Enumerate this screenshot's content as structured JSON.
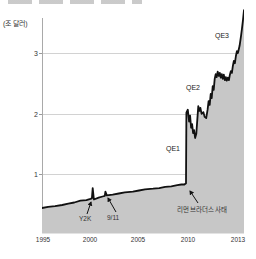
{
  "chart": {
    "unit_label": "(조 달러)",
    "y_tick_labels": [
      "3",
      "2",
      "1"
    ],
    "x_tick_labels": [
      "1995",
      "2000",
      "2005",
      "2010",
      "2013"
    ],
    "labels": {
      "qe1": "QE1",
      "qe2": "QE2",
      "qe3": "QE3",
      "y2k": "Y2K",
      "nine_eleven": "9/11",
      "lehman": "리먼 브라더스 사태"
    }
  },
  "chart_data": {
    "type": "area",
    "title": "",
    "ylabel": "(조 달러)",
    "xlabel": "",
    "x_axis": {
      "ticks": [
        "1995",
        "2000",
        "2005",
        "2010",
        "2013"
      ]
    },
    "y_axis": {
      "ticks": [
        1,
        2,
        3
      ],
      "range": [
        0,
        3.9
      ]
    },
    "grid": true,
    "legend": false,
    "colors": {
      "area_fill": "#c7c7c7",
      "line": "#111111",
      "grid": "#d2d2d2"
    },
    "annotations": [
      {
        "label": "Y2K",
        "x_frac": 0.251,
        "value": 0.77,
        "note": "brief spike near 2000"
      },
      {
        "label": "9/11",
        "x_frac": 0.314,
        "value": 0.71,
        "note": "brief bump in 2001"
      },
      {
        "label": "리먼 브라더스 사태",
        "x_frac": 0.714,
        "value": 0.85,
        "note": "vertical jump from ~0.85 to ~2.0"
      },
      {
        "label": "QE1",
        "x_frac": 0.75,
        "value": 2.0,
        "note": "plateau ~1.6-2.1"
      },
      {
        "label": "QE2",
        "x_frac": 0.85,
        "value": 2.65,
        "note": "rise to plateau ~2.6-2.7"
      },
      {
        "label": "QE3",
        "x_frac": 0.97,
        "value": 3.4,
        "note": "rise to ~3.7 by 2013"
      }
    ],
    "series": [
      {
        "points": [
          [
            0.0,
            0.44
          ],
          [
            0.03,
            0.46
          ],
          [
            0.065,
            0.47
          ],
          [
            0.1,
            0.49
          ],
          [
            0.13,
            0.51
          ],
          [
            0.16,
            0.53
          ],
          [
            0.19,
            0.56
          ],
          [
            0.22,
            0.57
          ],
          [
            0.24,
            0.59
          ],
          [
            0.247,
            0.6
          ],
          [
            0.251,
            0.77
          ],
          [
            0.257,
            0.58
          ],
          [
            0.28,
            0.61
          ],
          [
            0.3,
            0.63
          ],
          [
            0.311,
            0.64
          ],
          [
            0.314,
            0.71
          ],
          [
            0.321,
            0.65
          ],
          [
            0.35,
            0.66
          ],
          [
            0.38,
            0.68
          ],
          [
            0.41,
            0.7
          ],
          [
            0.45,
            0.71
          ],
          [
            0.48,
            0.73
          ],
          [
            0.51,
            0.75
          ],
          [
            0.55,
            0.76
          ],
          [
            0.58,
            0.77
          ],
          [
            0.61,
            0.79
          ],
          [
            0.64,
            0.8
          ],
          [
            0.67,
            0.82
          ],
          [
            0.69,
            0.83
          ],
          [
            0.705,
            0.83
          ],
          [
            0.713,
            0.85
          ],
          [
            0.715,
            2.02
          ],
          [
            0.722,
            2.07
          ],
          [
            0.728,
            1.87
          ],
          [
            0.733,
            1.97
          ],
          [
            0.738,
            1.77
          ],
          [
            0.743,
            1.83
          ],
          [
            0.748,
            1.68
          ],
          [
            0.753,
            1.73
          ],
          [
            0.758,
            1.6
          ],
          [
            0.764,
            1.67
          ],
          [
            0.769,
            1.9
          ],
          [
            0.774,
            2.13
          ],
          [
            0.779,
            2.05
          ],
          [
            0.784,
            2.1
          ],
          [
            0.79,
            2.0
          ],
          [
            0.799,
            2.03
          ],
          [
            0.805,
            1.95
          ],
          [
            0.813,
            1.93
          ],
          [
            0.82,
            2.07
          ],
          [
            0.825,
            2.21
          ],
          [
            0.83,
            2.15
          ],
          [
            0.835,
            2.33
          ],
          [
            0.84,
            2.26
          ],
          [
            0.845,
            2.46
          ],
          [
            0.85,
            2.4
          ],
          [
            0.855,
            2.58
          ],
          [
            0.86,
            2.66
          ],
          [
            0.865,
            2.61
          ],
          [
            0.87,
            2.7
          ],
          [
            0.875,
            2.63
          ],
          [
            0.88,
            2.68
          ],
          [
            0.885,
            2.6
          ],
          [
            0.89,
            2.66
          ],
          [
            0.895,
            2.58
          ],
          [
            0.9,
            2.65
          ],
          [
            0.905,
            2.56
          ],
          [
            0.91,
            2.61
          ],
          [
            0.915,
            2.55
          ],
          [
            0.92,
            2.6
          ],
          [
            0.925,
            2.56
          ],
          [
            0.93,
            2.65
          ],
          [
            0.935,
            2.71
          ],
          [
            0.94,
            2.68
          ],
          [
            0.945,
            2.8
          ],
          [
            0.95,
            2.88
          ],
          [
            0.955,
            2.84
          ],
          [
            0.96,
            2.96
          ],
          [
            0.965,
            3.04
          ],
          [
            0.97,
            3.01
          ],
          [
            0.978,
            3.13
          ],
          [
            0.985,
            3.29
          ],
          [
            0.99,
            3.42
          ],
          [
            0.995,
            3.56
          ],
          [
            1.0,
            3.72
          ]
        ]
      }
    ]
  }
}
